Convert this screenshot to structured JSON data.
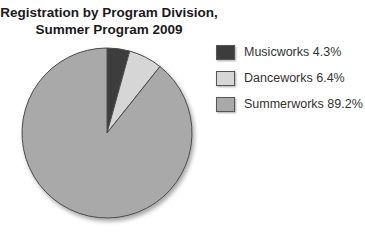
{
  "chart_data": {
    "type": "pie",
    "title": "Registration by Program Division, Summer Program 2009",
    "title_lines": [
      "Registration by Program Division,",
      "Summer Program 2009"
    ],
    "categories": [
      "Musicworks",
      "Danceworks",
      "Summerworks"
    ],
    "values": [
      4.3,
      6.4,
      89.2
    ],
    "units": "%",
    "colors": [
      "#3c3c3c",
      "#d6d6d6",
      "#a9a9a9"
    ],
    "legend_position": "right",
    "start_angle_deg": 0,
    "direction": "clockwise"
  },
  "legend": {
    "items": [
      {
        "label": "Musicworks 4.3%",
        "color": "#3c3c3c"
      },
      {
        "label": "Danceworks 6.4%",
        "color": "#d6d6d6"
      },
      {
        "label": "Summerworks 89.2%",
        "color": "#a9a9a9"
      }
    ]
  }
}
